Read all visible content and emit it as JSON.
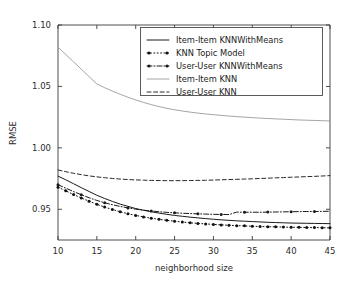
{
  "figure": {
    "background_color": "#ffffff",
    "width": 349,
    "height": 281
  },
  "chart_data": {
    "type": "line",
    "title": "",
    "xlabel": "neighborhood size",
    "ylabel": "RMSE",
    "xlim": [
      10,
      45
    ],
    "ylim": [
      0.925,
      1.1
    ],
    "xticks": [
      10,
      15,
      20,
      25,
      30,
      35,
      40,
      45
    ],
    "yticks": [
      0.95,
      1.0,
      1.05,
      1.1
    ],
    "ytick_labels": [
      "0.95",
      "1.00",
      "1.05",
      "1.10"
    ],
    "xtick_labels": [
      "10",
      "15",
      "20",
      "25",
      "30",
      "35",
      "40",
      "45"
    ],
    "grid": false,
    "legend_position": "upper right",
    "x": [
      10,
      11,
      12,
      13,
      14,
      15,
      16,
      17,
      18,
      19,
      20,
      21,
      22,
      23,
      24,
      25,
      26,
      27,
      28,
      29,
      30,
      31,
      32,
      33,
      34,
      35,
      36,
      37,
      38,
      39,
      40,
      41,
      42,
      43,
      44,
      45
    ],
    "series": [
      {
        "name": "Item-Item KNNWithMeans",
        "color": "#1a1a1a",
        "linestyle": "solid",
        "linewidth": 1.0,
        "marker": "none",
        "values": [
          0.977,
          0.974,
          0.9708,
          0.9676,
          0.9645,
          0.9614,
          0.9588,
          0.9564,
          0.9542,
          0.9524,
          0.9506,
          0.9492,
          0.948,
          0.9469,
          0.9459,
          0.945,
          0.9443,
          0.9436,
          0.943,
          0.9424,
          0.9419,
          0.9414,
          0.941,
          0.9406,
          0.9403,
          0.94,
          0.9397,
          0.9394,
          0.9392,
          0.939,
          0.9388,
          0.9387,
          0.9386,
          0.9385,
          0.9384,
          0.9383
        ]
      },
      {
        "name": "KNN Topic Model",
        "color": "#111111",
        "linestyle": "dotted",
        "linewidth": 1.0,
        "marker": "point",
        "values": [
          0.968,
          0.965,
          0.962,
          0.9592,
          0.9566,
          0.954,
          0.9518,
          0.9498,
          0.948,
          0.9464,
          0.945,
          0.9438,
          0.9427,
          0.9418,
          0.941,
          0.9403,
          0.9396,
          0.939,
          0.9385,
          0.9381,
          0.9377,
          0.9373,
          0.937,
          0.9367,
          0.9365,
          0.9362,
          0.936,
          0.9358,
          0.9357,
          0.9355,
          0.9354,
          0.9353,
          0.9352,
          0.9351,
          0.935,
          0.9349
        ]
      },
      {
        "name": "User-User KNNWithMeans",
        "color": "#1a1a1a",
        "linestyle": "dashdot",
        "linewidth": 1.0,
        "marker": "point",
        "values": [
          0.97,
          0.9672,
          0.9644,
          0.9618,
          0.9594,
          0.9572,
          0.9553,
          0.9537,
          0.9523,
          0.9511,
          0.9501,
          0.9493,
          0.9486,
          0.948,
          0.9475,
          0.9471,
          0.9468,
          0.9465,
          0.9463,
          0.9461,
          0.9459,
          0.9458,
          0.9457,
          0.9477,
          0.9476,
          0.9476,
          0.9476,
          0.9477,
          0.9478,
          0.9479,
          0.948,
          0.9481,
          0.9482,
          0.9482,
          0.9483,
          0.9484
        ]
      },
      {
        "name": "Item-Item KNN",
        "color": "#9a9a9a",
        "linestyle": "solid",
        "linewidth": 0.9,
        "marker": "none",
        "values": [
          1.082,
          1.076,
          1.07,
          1.064,
          1.058,
          1.052,
          1.049,
          1.0462,
          1.0436,
          1.0412,
          1.039,
          1.037,
          1.0352,
          1.0336,
          1.0322,
          1.031,
          1.03,
          1.0291,
          1.0283,
          1.0276,
          1.027,
          1.0264,
          1.0259,
          1.0254,
          1.025,
          1.0246,
          1.0242,
          1.0239,
          1.0236,
          1.0233,
          1.023,
          1.0227,
          1.0225,
          1.0223,
          1.0221,
          1.0219
        ]
      },
      {
        "name": "User-User KNN",
        "color": "#2a2a2a",
        "linestyle": "dashed",
        "linewidth": 1.0,
        "marker": "none",
        "values": [
          0.982,
          0.9806,
          0.9793,
          0.9782,
          0.9772,
          0.9764,
          0.9757,
          0.9751,
          0.9746,
          0.9742,
          0.9739,
          0.9737,
          0.9735,
          0.9734,
          0.9733,
          0.9733,
          0.9733,
          0.9734,
          0.9735,
          0.9736,
          0.9738,
          0.974,
          0.9742,
          0.9744,
          0.9746,
          0.9748,
          0.9751,
          0.9753,
          0.9756,
          0.9758,
          0.9761,
          0.9763,
          0.9766,
          0.9768,
          0.9771,
          0.9774
        ]
      }
    ],
    "legend_entries": [
      {
        "label": "Item-Item KNNWithMeans",
        "style": "solid"
      },
      {
        "label": "KNN Topic Model",
        "style": "dotted-marker"
      },
      {
        "label": "User-User KNNWithMeans",
        "style": "dashdot-marker"
      },
      {
        "label": "Item-Item KNN",
        "style": "solid-gray"
      },
      {
        "label": "User-User KNN",
        "style": "dashed"
      }
    ]
  }
}
